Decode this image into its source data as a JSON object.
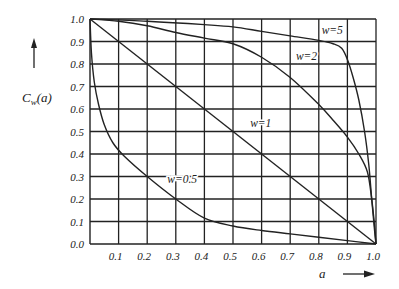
{
  "chart_data": {
    "type": "line",
    "title": "",
    "xlabel": "a",
    "ylabel": "C_w(a)",
    "ylabel_main": "C",
    "ylabel_sub": "w",
    "ylabel_tail": "(a)",
    "xlim": [
      0,
      1.0
    ],
    "ylim": [
      0,
      1.0
    ],
    "grid": true,
    "x_ticks": [
      "0.1",
      "0.2",
      "0.3",
      "0.4",
      "0.5",
      "0.6",
      "0.7",
      "0.8",
      "0.9",
      "1.0"
    ],
    "y_ticks": [
      "0.0",
      "0.1",
      "0.2",
      "0.3",
      "0.4",
      "0.5",
      "0.6",
      "0.7",
      "0.8",
      "0.9",
      "1.0"
    ],
    "series": [
      {
        "name": "w=0.5",
        "label_pos": [
          0.27,
          0.27
        ],
        "points": [
          [
            0,
            1.0
          ],
          [
            0.005,
            0.85
          ],
          [
            0.015,
            0.72
          ],
          [
            0.03,
            0.62
          ],
          [
            0.05,
            0.53
          ],
          [
            0.08,
            0.45
          ],
          [
            0.12,
            0.39
          ],
          [
            0.2,
            0.3
          ],
          [
            0.3,
            0.2
          ],
          [
            0.4,
            0.115
          ],
          [
            0.5,
            0.08
          ],
          [
            0.6,
            0.06
          ],
          [
            0.7,
            0.045
          ],
          [
            0.8,
            0.03
          ],
          [
            0.9,
            0.015
          ],
          [
            1.0,
            0.0
          ]
        ]
      },
      {
        "name": "w=1",
        "label_pos": [
          0.56,
          0.52
        ],
        "points": [
          [
            0,
            1.0
          ],
          [
            1.0,
            0.0
          ]
        ]
      },
      {
        "name": "w=2",
        "label_pos": [
          0.72,
          0.82
        ],
        "points": [
          [
            0,
            1.0
          ],
          [
            0.1,
            0.99
          ],
          [
            0.2,
            0.97
          ],
          [
            0.3,
            0.94
          ],
          [
            0.4,
            0.915
          ],
          [
            0.5,
            0.89
          ],
          [
            0.6,
            0.83
          ],
          [
            0.7,
            0.74
          ],
          [
            0.8,
            0.62
          ],
          [
            0.85,
            0.55
          ],
          [
            0.9,
            0.475
          ],
          [
            0.94,
            0.4
          ],
          [
            0.97,
            0.32
          ],
          [
            0.985,
            0.2
          ],
          [
            0.995,
            0.08
          ],
          [
            1.0,
            0.0
          ]
        ]
      },
      {
        "name": "w=5",
        "label_pos": [
          0.81,
          0.935
        ],
        "points": [
          [
            0,
            1.0
          ],
          [
            0.2,
            0.99
          ],
          [
            0.4,
            0.975
          ],
          [
            0.5,
            0.965
          ],
          [
            0.6,
            0.945
          ],
          [
            0.7,
            0.925
          ],
          [
            0.8,
            0.905
          ],
          [
            0.85,
            0.89
          ],
          [
            0.88,
            0.87
          ],
          [
            0.9,
            0.82
          ],
          [
            0.92,
            0.74
          ],
          [
            0.94,
            0.64
          ],
          [
            0.96,
            0.5
          ],
          [
            0.975,
            0.35
          ],
          [
            0.985,
            0.2
          ],
          [
            0.995,
            0.06
          ],
          [
            1.0,
            0.0
          ]
        ]
      }
    ]
  }
}
